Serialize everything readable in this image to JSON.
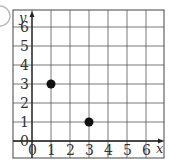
{
  "chart_data": {
    "type": "scatter",
    "title": "",
    "xlabel": "x",
    "ylabel": "y",
    "xlim": [
      0,
      6
    ],
    "ylim": [
      0,
      6
    ],
    "x_ticks": [
      "0",
      "1",
      "2",
      "3",
      "4",
      "5",
      "6"
    ],
    "y_ticks": [
      "0",
      "1",
      "2",
      "3",
      "4",
      "5",
      "6"
    ],
    "grid": true,
    "legend": null,
    "series": [
      {
        "name": "points",
        "points": [
          {
            "x": 1,
            "y": 3
          },
          {
            "x": 3,
            "y": 1
          }
        ]
      }
    ]
  },
  "colors": {
    "grid": "#555555",
    "axis": "#222222",
    "point": "#111111",
    "frame": "#444444"
  }
}
